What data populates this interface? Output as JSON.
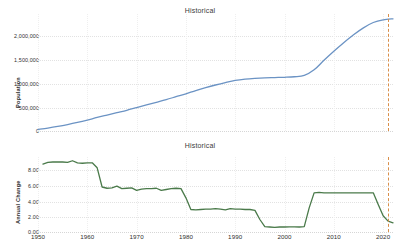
{
  "page": {
    "background": "#ffffff",
    "width": 400,
    "height": 251
  },
  "charts": {
    "top": {
      "title": "Historical",
      "ylabel": "Population",
      "yticks": [
        "2,000,000",
        "1,500,000",
        "1,000,000",
        "500,000",
        "0"
      ],
      "line_color": "#6b93c4",
      "marker_color": "#d98f4a"
    },
    "bottom": {
      "title": "Historical",
      "ylabel": "Annual Change",
      "yticks": [
        "8.00",
        "6.00",
        "4.00",
        "2.00",
        "0.00"
      ],
      "line_color": "#4a7a4a",
      "marker_color": "#d98f4a"
    },
    "xticks": [
      "1950",
      "1960",
      "1970",
      "1980",
      "1990",
      "2000",
      "2010",
      "2020"
    ]
  },
  "chart_data": [
    {
      "type": "line",
      "title": "Historical",
      "xlabel": "",
      "ylabel": "Population",
      "xlim": [
        1950,
        2022
      ],
      "ylim": [
        0,
        2200000
      ],
      "yticks": [
        0,
        500000,
        1000000,
        1500000,
        2000000
      ],
      "ytick_labels": [
        "0",
        "500,000",
        "1,000,000",
        "1,500,000",
        "2,000,000"
      ],
      "xticks": [
        1950,
        1960,
        1970,
        1980,
        1990,
        2000,
        2010,
        2020
      ],
      "grid": true,
      "legend": "none",
      "color": "#6b93c4",
      "annotations": [
        {
          "type": "vline",
          "x": 2021,
          "style": "dashed",
          "color": "#d98f4a"
        }
      ],
      "series": [
        {
          "name": "Population",
          "x": [
            1950,
            1952,
            1954,
            1956,
            1958,
            1960,
            1962,
            1964,
            1966,
            1968,
            1970,
            1972,
            1974,
            1976,
            1978,
            1980,
            1982,
            1984,
            1986,
            1988,
            1990,
            1992,
            1994,
            1996,
            1998,
            2000,
            2002,
            2004,
            2006,
            2008,
            2010,
            2012,
            2014,
            2016,
            2018,
            2020,
            2022
          ],
          "values": [
            30000,
            55000,
            85000,
            120000,
            160000,
            205000,
            255000,
            300000,
            345000,
            390000,
            440000,
            490000,
            540000,
            590000,
            645000,
            700000,
            760000,
            815000,
            865000,
            910000,
            950000,
            975000,
            990000,
            1000000,
            1005000,
            1010000,
            1020000,
            1045000,
            1150000,
            1330000,
            1500000,
            1660000,
            1810000,
            1940000,
            2040000,
            2090000,
            2110000
          ]
        }
      ]
    },
    {
      "type": "line",
      "title": "Historical",
      "xlabel": "",
      "ylabel": "Annual Change",
      "xlim": [
        1950,
        2022
      ],
      "ylim": [
        0,
        9.0
      ],
      "yticks": [
        0,
        2,
        4,
        6,
        8
      ],
      "ytick_labels": [
        "0.00",
        "2.00",
        "4.00",
        "6.00",
        "8.00"
      ],
      "xticks": [
        1950,
        1960,
        1970,
        1980,
        1990,
        2000,
        2010,
        2020
      ],
      "grid": true,
      "legend": "none",
      "color": "#4a7a4a",
      "annotations": [
        {
          "type": "vline",
          "x": 2021,
          "style": "dashed",
          "color": "#d98f4a"
        }
      ],
      "series": [
        {
          "name": "Annual Change",
          "x": [
            1951,
            1952,
            1953,
            1954,
            1955,
            1956,
            1957,
            1958,
            1959,
            1960,
            1961,
            1962,
            1963,
            1964,
            1965,
            1966,
            1967,
            1968,
            1969,
            1970,
            1971,
            1972,
            1973,
            1974,
            1975,
            1976,
            1977,
            1978,
            1979,
            1980,
            1981,
            1982,
            1983,
            1984,
            1985,
            1986,
            1987,
            1988,
            1989,
            1990,
            1991,
            1992,
            1993,
            1994,
            1995,
            1996,
            1997,
            1998,
            1999,
            2000,
            2001,
            2002,
            2003,
            2004,
            2005,
            2006,
            2007,
            2008,
            2009,
            2010,
            2011,
            2012,
            2013,
            2014,
            2015,
            2016,
            2017,
            2018,
            2019,
            2020,
            2021,
            2022
          ],
          "values": [
            8.15,
            8.35,
            8.4,
            8.4,
            8.4,
            8.35,
            8.55,
            8.3,
            8.25,
            8.3,
            8.3,
            7.7,
            5.4,
            5.25,
            5.3,
            5.5,
            5.2,
            5.25,
            5.3,
            5.0,
            5.15,
            5.2,
            5.2,
            5.25,
            5.0,
            5.1,
            5.2,
            5.25,
            5.2,
            4.1,
            2.7,
            2.65,
            2.7,
            2.75,
            2.75,
            2.8,
            2.75,
            2.65,
            2.8,
            2.75,
            2.75,
            2.7,
            2.7,
            2.6,
            1.5,
            0.65,
            0.6,
            0.55,
            0.6,
            0.6,
            0.62,
            0.62,
            0.6,
            0.65,
            2.9,
            4.7,
            4.75,
            4.7,
            4.7,
            4.7,
            4.7,
            4.7,
            4.7,
            4.7,
            4.7,
            4.7,
            4.7,
            4.7,
            3.3,
            1.95,
            1.3,
            1.1
          ]
        }
      ]
    }
  ]
}
